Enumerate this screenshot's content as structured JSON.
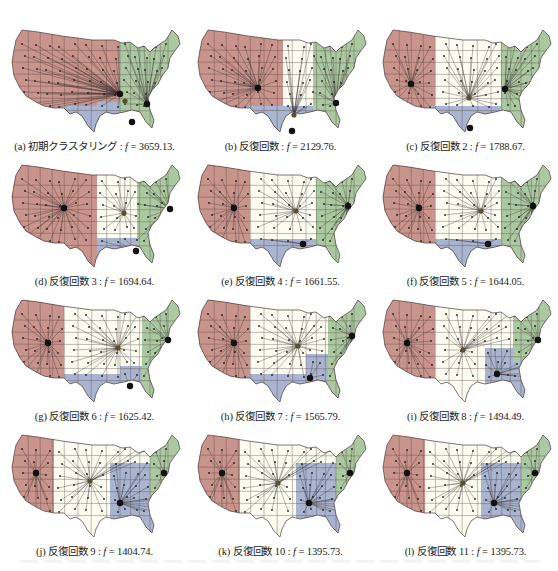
{
  "figure": {
    "colors": {
      "west": "#c9948c",
      "central": "#fbfbf0",
      "southeast": "#a9b5d0",
      "northeast": "#abc9a0",
      "border": "#4a3a3a",
      "edge": "#3a3030",
      "centroid": "#111111"
    },
    "panels": [
      {
        "label": "(a) 初期クラスタリング",
        "f_label": "f",
        "value": "3659.13",
        "caption_suffix": ".",
        "split": {
          "wc": 118,
          "cs": 118,
          "sn": 118,
          "blueWest": 95,
          "blueNorth": 84,
          "greenWest": 118
        },
        "centers": [
          [
            118,
            76
          ],
          [
            123,
            83
          ],
          [
            130,
            104
          ],
          [
            145,
            86
          ]
        ],
        "big": 0
      },
      {
        "label": "(b) 反復回数",
        "f_label": "f",
        "value": "2129.76",
        "caption_suffix": ".",
        "split": {
          "wc": 95,
          "cs": 135,
          "sn": 135,
          "blueWest": 72,
          "blueNorth": 92,
          "greenWest": 125
        },
        "centers": [
          [
            70,
            70
          ],
          [
            106,
            97
          ],
          [
            104,
            113
          ],
          [
            148,
            85
          ]
        ],
        "big": 0
      },
      {
        "label": "(c) 反復回数 2",
        "f_label": "f",
        "value": "1788.67",
        "caption_suffix": ".",
        "split": {
          "wc": 62,
          "cs": 130,
          "sn": 130,
          "blueWest": 62,
          "blueNorth": 95,
          "greenWest": 128
        },
        "centers": [
          [
            38,
            66
          ],
          [
            96,
            80
          ],
          [
            97,
            110
          ],
          [
            132,
            71
          ]
        ],
        "big": 0
      },
      {
        "label": "(d) 反復回数 3",
        "f_label": "f",
        "value": "1694.64",
        "caption_suffix": ".",
        "split": {
          "wc": 95,
          "cs": 130,
          "sn": 118,
          "blueWest": 95,
          "blueNorth": 85,
          "greenWest": 135
        },
        "centers": [
          [
            62,
            55
          ],
          [
            122,
            60
          ],
          [
            134,
            98
          ],
          [
            168,
            56
          ]
        ],
        "big": 0
      },
      {
        "label": "(e) 反復回数 4",
        "f_label": "f",
        "value": "1661.55",
        "caption_suffix": ".",
        "split": {
          "wc": 62,
          "cs": 118,
          "sn": 118,
          "blueWest": 62,
          "blueNorth": 86,
          "greenWest": 128
        },
        "centers": [
          [
            46,
            55
          ],
          [
            108,
            58
          ],
          [
            115,
            91
          ],
          [
            160,
            53
          ]
        ],
        "big": 0
      },
      {
        "label": "(f) 反復回数 5",
        "f_label": "f",
        "value": "1644.05",
        "caption_suffix": ".",
        "split": {
          "wc": 62,
          "cs": 118,
          "sn": 118,
          "blueWest": 62,
          "blueNorth": 86,
          "greenWest": 128
        },
        "centers": [
          [
            46,
            55
          ],
          [
            108,
            58
          ],
          [
            115,
            91
          ],
          [
            160,
            53
          ]
        ],
        "big": 0
      },
      {
        "label": "(g) 反復回数 6",
        "f_label": "f",
        "value": "1625.42",
        "caption_suffix": ".",
        "split": {
          "wc": 62,
          "cs": 118,
          "sn": 112,
          "blueWest": 118,
          "blueNorth": 78,
          "greenWest": 140
        },
        "centers": [
          [
            46,
            55
          ],
          [
            116,
            60
          ],
          [
            128,
            98
          ],
          [
            166,
            52
          ]
        ],
        "big": 0
      },
      {
        "label": "(h) 反復回数 7",
        "f_label": "f",
        "value": "1565.79",
        "caption_suffix": ".",
        "split": {
          "wc": 62,
          "cs": 118,
          "sn": 112,
          "blueWest": 118,
          "blueNorth": 66,
          "greenWest": 140
        },
        "centers": [
          [
            46,
            55
          ],
          [
            110,
            58
          ],
          [
            122,
            90
          ],
          [
            164,
            48
          ]
        ],
        "big": 0
      },
      {
        "label": "(i) 反復回数 8",
        "f_label": "f",
        "value": "1494.49",
        "caption_suffix": ".",
        "split": {
          "wc": 62,
          "cs": 112,
          "sn": 112,
          "blueWest": 112,
          "blueNorth": 60,
          "greenWest": 140
        },
        "centers": [
          [
            34,
            55
          ],
          [
            90,
            62
          ],
          [
            124,
            86
          ],
          [
            165,
            52
          ]
        ],
        "big": 0
      },
      {
        "label": "(j) 反復回数 9",
        "f_label": "f",
        "value": "1404.74",
        "caption_suffix": ".",
        "split": {
          "wc": 52,
          "cs": 108,
          "sn": 108,
          "blueWest": 108,
          "blueNorth": 40,
          "greenWest": 148
        },
        "centers": [
          [
            34,
            50
          ],
          [
            88,
            58
          ],
          [
            118,
            80
          ],
          [
            162,
            50
          ]
        ],
        "big": 0
      },
      {
        "label": "(k) 反復回数 10",
        "f_label": "f",
        "value": "1395.73",
        "caption_suffix": ".",
        "split": {
          "wc": 52,
          "cs": 108,
          "sn": 108,
          "blueWest": 108,
          "blueNorth": 40,
          "greenWest": 148
        },
        "centers": [
          [
            34,
            50
          ],
          [
            90,
            60
          ],
          [
            121,
            80
          ],
          [
            162,
            50
          ]
        ],
        "big": 0
      },
      {
        "label": "(l) 反復回数 11",
        "f_label": "f",
        "value": "1395.73",
        "caption_suffix": ".",
        "split": {
          "wc": 52,
          "cs": 108,
          "sn": 108,
          "blueWest": 108,
          "blueNorth": 40,
          "greenWest": 148
        },
        "centers": [
          [
            34,
            50
          ],
          [
            90,
            60
          ],
          [
            121,
            80
          ],
          [
            162,
            50
          ]
        ],
        "big": 0
      }
    ]
  }
}
